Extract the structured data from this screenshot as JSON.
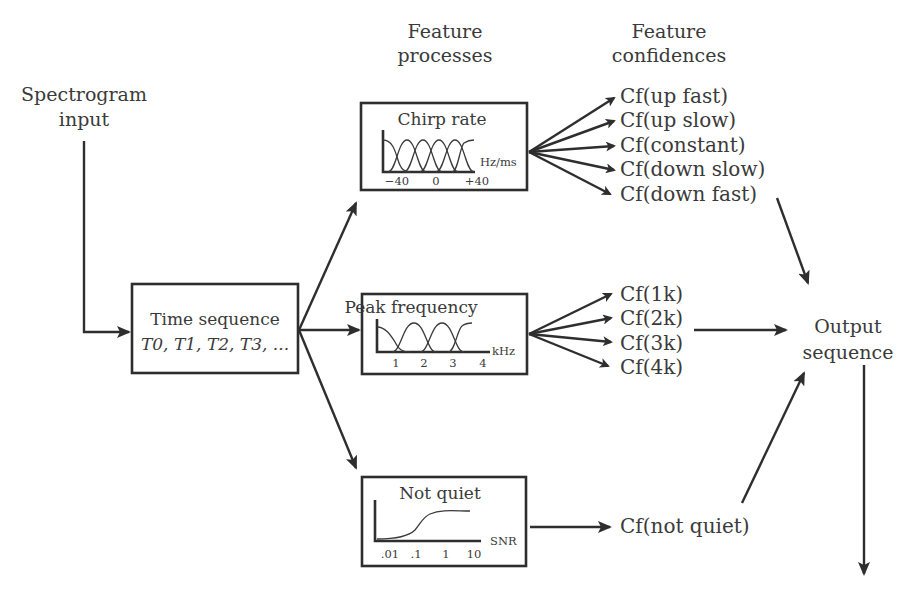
{
  "diagram": {
    "input": {
      "line1": "Spectrogram",
      "line2": "input"
    },
    "headers": {
      "processes": {
        "line1": "Feature",
        "line2": "processes"
      },
      "confidences": {
        "line1": "Feature",
        "line2": "confidences"
      }
    },
    "time_sequence": {
      "title": "Time sequence",
      "subtitle": "T0, T1, T2, T3, ..."
    },
    "processes": [
      {
        "title": "Chirp rate",
        "unit": "Hz/ms",
        "ticks": [
          "−40",
          "0",
          "+40"
        ],
        "outputs": [
          "Cf(up fast)",
          "Cf(up slow)",
          "Cf(constant)",
          "Cf(down slow)",
          "Cf(down fast)"
        ]
      },
      {
        "title": "Peak frequency",
        "unit": "kHz",
        "ticks": [
          "1",
          "2",
          "3",
          "4"
        ],
        "outputs": [
          "Cf(1k)",
          "Cf(2k)",
          "Cf(3k)",
          "Cf(4k)"
        ]
      },
      {
        "title": "Not quiet",
        "unit": "SNR",
        "ticks": [
          ".01",
          ".1",
          "1",
          "10"
        ],
        "outputs": [
          "Cf(not quiet)"
        ]
      }
    ],
    "output": {
      "line1": "Output",
      "line2": "sequence"
    }
  },
  "colors": {
    "ink": "#2e2e2e",
    "text": "#3a3a3a",
    "background": "#ffffff"
  }
}
